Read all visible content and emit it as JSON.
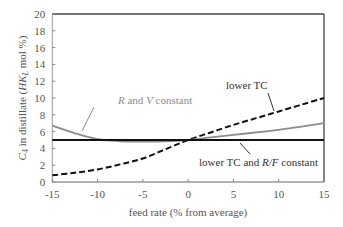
{
  "chart_data": {
    "type": "line",
    "title": "",
    "xlabel": "feed rate (% from average)",
    "ylabel_parts": [
      "C",
      "4",
      " in distillate (",
      "HK",
      "L",
      " mol %)"
    ],
    "ylabel": "C4 in distillate (HKL mol %)",
    "xlim": [
      -15,
      15
    ],
    "ylim": [
      0,
      20
    ],
    "x_ticks": [
      -15,
      -10,
      -5,
      0,
      5,
      10,
      15
    ],
    "y_ticks": [
      0,
      2,
      4,
      6,
      8,
      10,
      12,
      14,
      16,
      18,
      20
    ],
    "grid": false,
    "legend": "none (inline annotations)",
    "series": [
      {
        "name": "lower TC",
        "style": "dashed",
        "color": "#111111",
        "x": [
          -15,
          -12.5,
          -10,
          -7.5,
          -5,
          -2.5,
          0,
          2.5,
          5,
          7.5,
          10,
          12.5,
          15
        ],
        "values": [
          0.8,
          1.1,
          1.5,
          2.1,
          2.8,
          3.9,
          5.0,
          5.9,
          6.8,
          7.6,
          8.4,
          9.2,
          10.0
        ]
      },
      {
        "name": "R and V constant",
        "style": "solid",
        "color": "#8c8c8c",
        "x": [
          -15,
          -12.5,
          -10,
          -7.5,
          -5,
          -2.5,
          0,
          2.5,
          5,
          7.5,
          10,
          12.5,
          15
        ],
        "values": [
          6.7,
          5.8,
          5.1,
          4.85,
          4.8,
          4.85,
          5.0,
          5.3,
          5.6,
          5.9,
          6.2,
          6.6,
          7.0
        ]
      },
      {
        "name": "lower TC and R/F constant",
        "style": "solid",
        "color": "#111111",
        "x": [
          -15,
          15
        ],
        "values": [
          5.0,
          5.0
        ]
      }
    ],
    "annotations": [
      {
        "text_parts": [
          "R",
          " and ",
          "V",
          " constant"
        ],
        "text": "R and V constant",
        "color": "#8c8c8c",
        "points_to": "R and V constant"
      },
      {
        "text": "lower TC",
        "color": "#222222",
        "points_to": "lower TC"
      },
      {
        "text_parts": [
          "lower TC and ",
          "R/F",
          " constant"
        ],
        "text": "lower TC and R/F constant",
        "color": "#222222",
        "points_to": "lower TC and R/F constant"
      }
    ]
  },
  "colors": {
    "axis": "#666666",
    "frame_top": "#444444",
    "text": "#555555"
  }
}
